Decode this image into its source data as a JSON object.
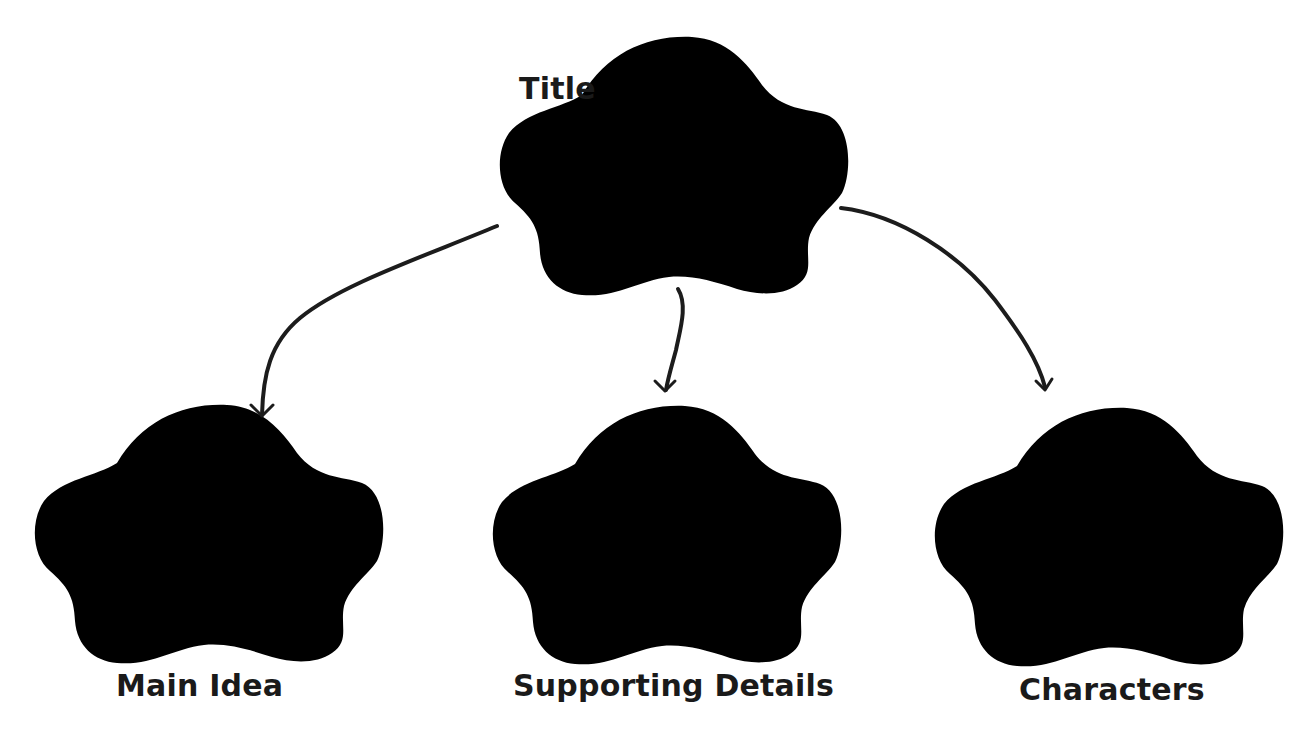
{
  "diagram": {
    "type": "graphic-organizer",
    "nodes": [
      {
        "id": "title",
        "label": "Title"
      },
      {
        "id": "main-idea",
        "label": "Main Idea"
      },
      {
        "id": "supporting-details",
        "label": "Supporting Details"
      },
      {
        "id": "characters",
        "label": "Characters"
      }
    ],
    "edges": [
      {
        "from": "title",
        "to": "main-idea"
      },
      {
        "from": "title",
        "to": "supporting-details"
      },
      {
        "from": "title",
        "to": "characters"
      }
    ],
    "colors": {
      "background": "#ffffff",
      "shape_outline": "#6e6e6e",
      "arrow": "#1c1c1c",
      "text": "#1a1a1a"
    }
  }
}
